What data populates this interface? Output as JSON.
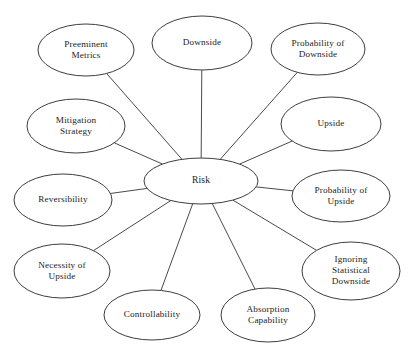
{
  "diagram": {
    "title": "Risk",
    "type": "radial-mind-map",
    "center": {
      "id": "risk",
      "label": "Risk",
      "lines": [
        "Risk"
      ],
      "cx": 201,
      "cy": 181,
      "rx": 57,
      "ry": 23
    },
    "style": {
      "background": "#ffffff",
      "node_fill": "#ffffff",
      "node_stroke": "#3d3d3d",
      "spoke_stroke": "#4a4a4a",
      "text_color": "#1c1c1c"
    },
    "nodes": [
      {
        "id": "preeminent-metrics",
        "label": "Preeminent Metrics",
        "lines": [
          "Preeminent",
          "Metrics"
        ],
        "cx": 86,
        "cy": 50,
        "rx": 48,
        "ry": 26
      },
      {
        "id": "downside",
        "label": "Downside",
        "lines": [
          "Downside"
        ],
        "cx": 202,
        "cy": 43,
        "rx": 50,
        "ry": 27
      },
      {
        "id": "probability-of-downside",
        "label": "Probability of Downside",
        "lines": [
          "Probability of",
          "Downside"
        ],
        "cx": 318,
        "cy": 49,
        "rx": 47,
        "ry": 26
      },
      {
        "id": "upside",
        "label": "Upside",
        "lines": [
          "Upside"
        ],
        "cx": 331,
        "cy": 124,
        "rx": 50,
        "ry": 27
      },
      {
        "id": "probability-of-upside",
        "label": "Probability of Upside",
        "lines": [
          "Probability of",
          "Upside"
        ],
        "cx": 341,
        "cy": 196,
        "rx": 49,
        "ry": 26
      },
      {
        "id": "ignoring-statistical-downside",
        "label": "Ignoring Statistical Downside",
        "lines": [
          "Ignoring",
          "Statistical",
          "Downside"
        ],
        "cx": 351,
        "cy": 271,
        "rx": 49,
        "ry": 29
      },
      {
        "id": "absorption-capability",
        "label": "Absorption Capability",
        "lines": [
          "Absorption",
          "Capability"
        ],
        "cx": 268,
        "cy": 315,
        "rx": 47,
        "ry": 27
      },
      {
        "id": "controllability",
        "label": "Controllability",
        "lines": [
          "Controllability"
        ],
        "cx": 152,
        "cy": 315,
        "rx": 48,
        "ry": 25
      },
      {
        "id": "necessity-of-upside",
        "label": "Necessity of Upside",
        "lines": [
          "Necessity of",
          "Upside"
        ],
        "cx": 62,
        "cy": 271,
        "rx": 48,
        "ry": 27
      },
      {
        "id": "reversibility",
        "label": "Reversibility",
        "lines": [
          "Reversibility"
        ],
        "cx": 63,
        "cy": 200,
        "rx": 49,
        "ry": 26
      },
      {
        "id": "mitigation-strategy",
        "label": "Mitigation Strategy",
        "lines": [
          "Mitigation",
          "Strategy"
        ],
        "cx": 76,
        "cy": 126,
        "rx": 49,
        "ry": 27
      }
    ]
  }
}
